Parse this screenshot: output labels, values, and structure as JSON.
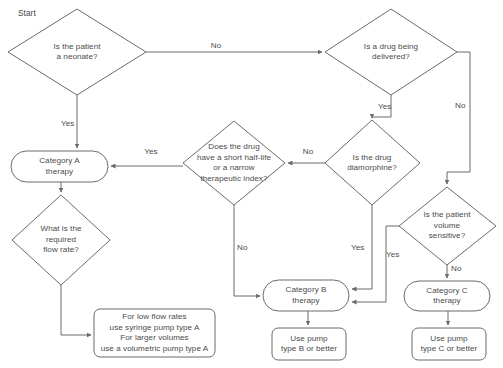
{
  "diagram": {
    "start_label": "Start",
    "stroke_color": "#6b6b6b",
    "text_color": "#4a4a4a",
    "background_color": "#ffffff"
  },
  "nodes": {
    "neonate": {
      "id": "neonate",
      "type": "decision",
      "text": "Is the patient\na neonate?"
    },
    "drug_delivered": {
      "id": "drug_delivered",
      "type": "decision",
      "text": "Is a drug being\ndelivered?"
    },
    "half_life": {
      "id": "half_life",
      "type": "decision",
      "text": "Does the drug\nhave a short half-life\nor a narrow\ntherapeutic index?"
    },
    "diamorphine": {
      "id": "diamorphine",
      "type": "decision",
      "text": "Is the drug\ndiamorphine?"
    },
    "volume_sensitive": {
      "id": "volume_sensitive",
      "type": "decision",
      "text": "Is the patient\nvolume\nsensitive?"
    },
    "flow_rate": {
      "id": "flow_rate",
      "type": "decision",
      "text": "What is the\nrequired\nflow rate?"
    },
    "category_a": {
      "id": "category_a",
      "type": "process",
      "text": "Category A\ntherapy"
    },
    "category_b": {
      "id": "category_b",
      "type": "process",
      "text": "Category B\ntherapy"
    },
    "category_c": {
      "id": "category_c",
      "type": "process",
      "text": "Category C\ntherapy"
    },
    "pump_a": {
      "id": "pump_a",
      "type": "process",
      "text": "For low flow rates\nuse syringe pump type A\nFor larger volumes\nuse a volumetric pump type A"
    },
    "pump_b": {
      "id": "pump_b",
      "type": "process",
      "text": "Use pump\ntype B or better"
    },
    "pump_c": {
      "id": "pump_c",
      "type": "process",
      "text": "Use pump\ntype C or better"
    }
  },
  "edge_labels": {
    "neonate_no": "No",
    "neonate_yes": "Yes",
    "drug_delivered_yes": "Yes",
    "drug_delivered_no": "No",
    "half_life_yes": "Yes",
    "half_life_no": "No",
    "diamorphine_no": "No",
    "diamorphine_yes": "Yes",
    "volume_sensitive_yes": "Yes",
    "volume_sensitive_no": "No"
  }
}
